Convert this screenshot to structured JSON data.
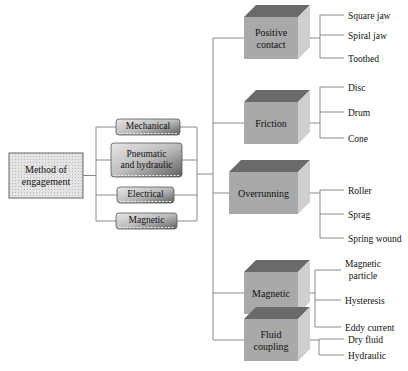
{
  "root": {
    "label_lines": [
      "Method of",
      "engagement"
    ]
  },
  "methods": [
    {
      "id": "mechanical",
      "label_lines": [
        "Mechanical"
      ]
    },
    {
      "id": "pneumatic-hydraulic",
      "label_lines": [
        "Pneumatic",
        "and hydraulic"
      ]
    },
    {
      "id": "electrical",
      "label_lines": [
        "Electrical"
      ]
    },
    {
      "id": "magnetic",
      "label_lines": [
        "Magnetic"
      ]
    }
  ],
  "types": [
    {
      "id": "positive-contact",
      "label_lines": [
        "Positive",
        "contact"
      ],
      "subtypes": [
        "Square jaw",
        "Spiral jaw",
        "Toothed"
      ]
    },
    {
      "id": "friction",
      "label_lines": [
        "Friction"
      ],
      "subtypes": [
        "Disc",
        "Drum",
        "Cone"
      ]
    },
    {
      "id": "overrunning",
      "label_lines": [
        "Overrunning"
      ],
      "subtypes": [
        "Roller",
        "Sprag",
        "Spring wound"
      ]
    },
    {
      "id": "magnetic",
      "label_lines": [
        "Magnetic"
      ],
      "subtypes": [
        "Magnetic particle",
        "Hysteresis",
        "Eddy current"
      ]
    },
    {
      "id": "fluid-coupling",
      "label_lines": [
        "Fluid",
        "coupling"
      ],
      "subtypes": [
        "Dry fluid",
        "Hydraulic"
      ]
    }
  ],
  "colors": {
    "line": "#8a8a8a",
    "box_front": "#a9a9a9",
    "box_top": "#6a6a6a",
    "box_side": "#cfcfcf",
    "method_fill": "#bdbdbd",
    "root_fill": "#d6d6d6"
  }
}
